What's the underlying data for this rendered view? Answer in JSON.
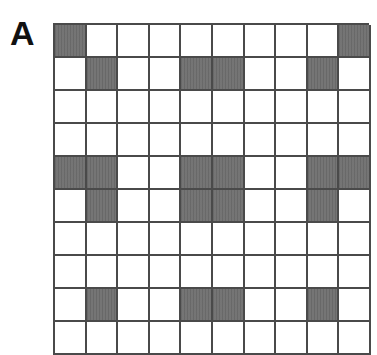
{
  "figure": {
    "panel_label": "A",
    "grid": {
      "columns": 10,
      "rows_visible": 10,
      "fill_color": "#6f6f6f",
      "line_color": "#4a4a4a",
      "empty_color": "#ffffff",
      "filled_cells": [
        [
          0,
          9
        ],
        [
          1,
          4,
          5,
          8
        ],
        [],
        [],
        [
          0,
          1,
          4,
          5,
          8,
          9
        ],
        [
          1,
          4,
          5,
          8
        ],
        [],
        [],
        [
          1,
          4,
          5,
          8
        ],
        []
      ]
    }
  }
}
